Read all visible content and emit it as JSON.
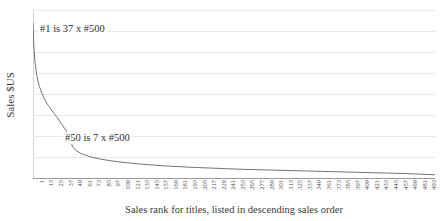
{
  "chart_data": {
    "type": "line",
    "title": "",
    "xlabel": "Sales rank for titles, listed in descending sales order",
    "ylabel": "Sales $US",
    "grid": true,
    "legend": "none",
    "gridline_count": 9,
    "xlim": [
      1,
      500
    ],
    "ylim": [
      0,
      40
    ],
    "y_tick_labels": [],
    "xtick_step": 12,
    "xtick_labels": [
      1,
      13,
      25,
      37,
      49,
      61,
      73,
      85,
      97,
      109,
      121,
      133,
      145,
      157,
      169,
      181,
      193,
      205,
      217,
      229,
      241,
      253,
      265,
      277,
      289,
      301,
      313,
      325,
      337,
      349,
      361,
      373,
      385,
      397,
      409,
      421,
      433,
      445,
      457,
      469,
      481,
      493
    ],
    "annotations": [
      {
        "name": "top",
        "text": "#1 is 37 x #500"
      },
      {
        "name": "fifty",
        "text": "#50 is 7 x #500"
      }
    ],
    "series": [
      {
        "name": "Sales by rank",
        "color": "#767171",
        "x": [
          1,
          2,
          3,
          4,
          5,
          6,
          7,
          8,
          9,
          10,
          12,
          14,
          16,
          18,
          20,
          22,
          24,
          26,
          28,
          30,
          32,
          34,
          36,
          38,
          40,
          42,
          44,
          46,
          48,
          50,
          55,
          60,
          65,
          70,
          75,
          80,
          85,
          90,
          95,
          100,
          110,
          120,
          130,
          140,
          150,
          160,
          170,
          180,
          190,
          200,
          220,
          240,
          260,
          280,
          300,
          320,
          340,
          360,
          380,
          400,
          420,
          440,
          460,
          480,
          500
        ],
        "y": [
          37.0,
          31.5,
          28.6,
          26.8,
          25.4,
          24.3,
          23.4,
          22.6,
          21.9,
          21.3,
          20.3,
          19.4,
          18.7,
          18.0,
          17.4,
          16.9,
          16.3,
          15.8,
          15.3,
          14.8,
          14.3,
          13.7,
          13.2,
          12.6,
          12.0,
          11.4,
          10.7,
          10.0,
          9.2,
          7.6,
          6.7,
          6.1,
          5.7,
          5.4,
          5.1,
          4.9,
          4.7,
          4.55,
          4.4,
          4.25,
          4.0,
          3.8,
          3.6,
          3.45,
          3.3,
          3.15,
          3.05,
          2.95,
          2.85,
          2.75,
          2.6,
          2.45,
          2.3,
          2.2,
          2.1,
          2.0,
          1.9,
          1.8,
          1.7,
          1.6,
          1.5,
          1.4,
          1.3,
          1.15,
          1.0
        ]
      }
    ]
  },
  "colors": {
    "series": "#767171",
    "gridline": "#e8e8e8",
    "axis": "#9a9a9a",
    "text": "#3b3b3b"
  }
}
